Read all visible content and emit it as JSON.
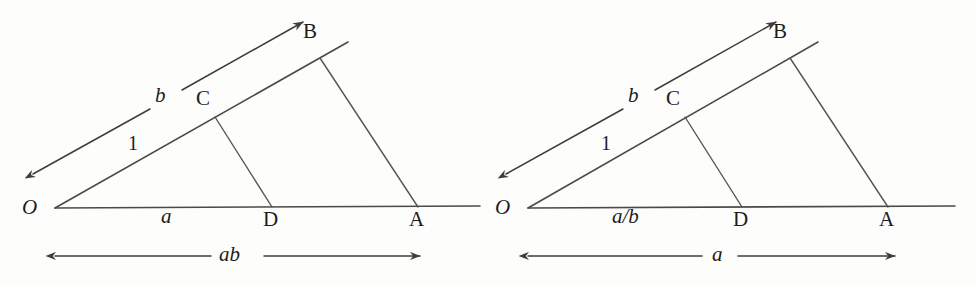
{
  "page": {
    "background_color": "#fdfdfc",
    "ink_color": "#3d3d3d",
    "width": 975,
    "height": 285
  },
  "figures": [
    {
      "id": "multiplication-construction",
      "points": {
        "O": {
          "label": "O",
          "x": 55,
          "y": 208
        },
        "A": {
          "label": "A",
          "x": 418,
          "y": 207
        },
        "B": {
          "label": "B",
          "x": 320,
          "y": 58
        },
        "C": {
          "label": "C",
          "x": 215,
          "y": 117
        },
        "D": {
          "label": "D",
          "x": 272,
          "y": 207
        }
      },
      "segment_labels": {
        "unit": "1",
        "base_lower": "a",
        "ray_upper": "b"
      },
      "result_label": "ab"
    },
    {
      "id": "division-construction",
      "points": {
        "O": {
          "label": "O",
          "x": 528,
          "y": 208
        },
        "A": {
          "label": "A",
          "x": 888,
          "y": 207
        },
        "B": {
          "label": "B",
          "x": 790,
          "y": 58
        },
        "C": {
          "label": "C",
          "x": 685,
          "y": 117
        },
        "D": {
          "label": "D",
          "x": 742,
          "y": 207
        }
      },
      "segment_labels": {
        "unit": "1",
        "base_lower": "a/b",
        "ray_upper": "b"
      },
      "result_label": "a"
    }
  ]
}
